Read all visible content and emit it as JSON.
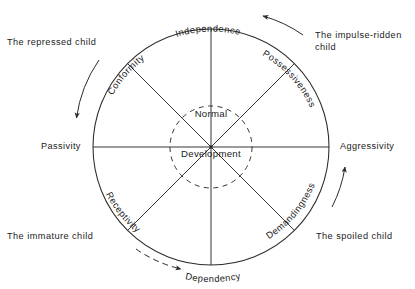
{
  "diagram": {
    "type": "radial-sector-diagram",
    "center_labels": {
      "upper": "Normal",
      "lower": "Development"
    },
    "axis_labels": {
      "left": "Passivity",
      "right": "Aggressivity",
      "top": "Independence",
      "bottom": "Dependency"
    },
    "rim_labels": [
      {
        "id": "independence",
        "text": "Independence",
        "angle_deg": 90,
        "position": "top"
      },
      {
        "id": "possessiveness",
        "text": "Possessiveness",
        "angle_deg": 45,
        "position": "upper-right"
      },
      {
        "id": "aggressivity",
        "text": "Aggressivity",
        "angle_deg": 0,
        "position": "right"
      },
      {
        "id": "demandingness",
        "text": "Demandingness",
        "angle_deg": -45,
        "position": "lower-right"
      },
      {
        "id": "dependency",
        "text": "Dependency",
        "angle_deg": -90,
        "position": "bottom"
      },
      {
        "id": "receptivity",
        "text": "Receptivity",
        "angle_deg": -135,
        "position": "lower-left"
      },
      {
        "id": "passivity",
        "text": "Passivity",
        "angle_deg": 180,
        "position": "left"
      },
      {
        "id": "conformity",
        "text": "Conformity",
        "angle_deg": 135,
        "position": "upper-left"
      }
    ],
    "quadrant_labels": [
      {
        "id": "repressed",
        "text": "The repressed child",
        "position": "upper-left"
      },
      {
        "id": "impulse",
        "text": "The impulse-ridden\nchild",
        "position": "upper-right"
      },
      {
        "id": "immature",
        "text": "The immature child",
        "position": "lower-left"
      },
      {
        "id": "spoiled",
        "text": "The spoiled child",
        "position": "lower-right"
      }
    ],
    "flow_arrows": [
      {
        "id": "top-arrow",
        "direction": "counterclockwise",
        "near": "Independence"
      },
      {
        "id": "left-arrow",
        "direction": "downward",
        "near": "Conformity / Passivity"
      },
      {
        "id": "bottom-arrow",
        "direction": "rightward",
        "near": "Receptivity / Dependency"
      },
      {
        "id": "right-arrow",
        "direction": "upward",
        "near": "Demandingness / Aggressivity"
      }
    ],
    "colors": {
      "stroke": "#2b2b2b",
      "text": "#1b1b1b",
      "background": "#ffffff"
    }
  }
}
